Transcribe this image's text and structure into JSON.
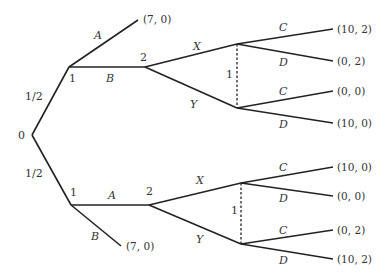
{
  "diagram": {
    "type": "extensive-form-game-tree",
    "root": {
      "label": "0"
    },
    "chance_probabilities": {
      "upper": "1/2",
      "lower": "1/2"
    },
    "upper_subtree": {
      "player1_label": "1",
      "actions": {
        "a": "A",
        "b": "B"
      },
      "terminal_A": "(7, 0)",
      "player2_label": "2",
      "p2_actions": {
        "x": "X",
        "y": "Y"
      },
      "infoset_label": "1",
      "after_X": {
        "c": "C",
        "d": "D",
        "payoff_C": "(10, 2)",
        "payoff_D": "(0, 2)"
      },
      "after_Y": {
        "c": "C",
        "d": "D",
        "payoff_C": "(0, 0)",
        "payoff_D": "(10, 0)"
      }
    },
    "lower_subtree": {
      "player1_label": "1",
      "actions": {
        "a": "A",
        "b": "B"
      },
      "terminal_B": "(7, 0)",
      "player2_label": "2",
      "p2_actions": {
        "x": "X",
        "y": "Y"
      },
      "infoset_label": "1",
      "after_X": {
        "c": "C",
        "d": "D",
        "payoff_C": "(10, 0)",
        "payoff_D": "(0, 0)"
      },
      "after_Y": {
        "c": "C",
        "d": "D",
        "payoff_C": "(0, 2)",
        "payoff_D": "(10, 2)"
      }
    }
  }
}
